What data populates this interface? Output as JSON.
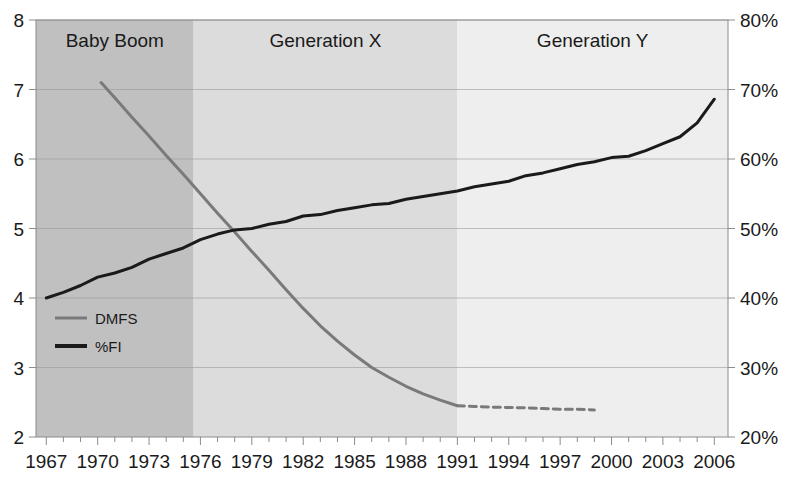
{
  "chart_data": {
    "type": "line",
    "title": "",
    "subtitle": "",
    "xlabel": "",
    "ylabel": "",
    "y2label": "",
    "xlim": [
      1966.4,
      2006.8
    ],
    "ylim": [
      2,
      8
    ],
    "y2lim": [
      20,
      80
    ],
    "grid": true,
    "legend_position": "inside-left",
    "x_tick_labels": [
      "1967",
      "1970",
      "1973",
      "1976",
      "1979",
      "1982",
      "1985",
      "1988",
      "1991",
      "1994",
      "1997",
      "2000",
      "2003",
      "2006"
    ],
    "x_tick_values": [
      1967,
      1970,
      1973,
      1976,
      1979,
      1982,
      1985,
      1988,
      1991,
      1994,
      1997,
      2000,
      2003,
      2006
    ],
    "x_minor_tick_step": 1,
    "y_tick_labels": [
      "2",
      "3",
      "4",
      "5",
      "6",
      "7",
      "8"
    ],
    "y_tick_values": [
      2,
      3,
      4,
      5,
      6,
      7,
      8
    ],
    "y2_tick_labels": [
      "20%",
      "30%",
      "40%",
      "50%",
      "60%",
      "70%",
      "80%"
    ],
    "y2_tick_values": [
      20,
      30,
      40,
      50,
      60,
      70,
      80
    ],
    "bands": [
      {
        "label": "Baby Boom",
        "x_start": 1966.4,
        "x_end": 1975.6,
        "color": "#c0c0c0"
      },
      {
        "label": "Generation X",
        "x_start": 1975.6,
        "x_end": 1991.0,
        "color": "#dcdcdc"
      },
      {
        "label": "Generation Y",
        "x_start": 1991.0,
        "x_end": 2006.8,
        "color": "#eeeeee"
      }
    ],
    "series": [
      {
        "name": "DMFS",
        "axis": "left",
        "color": "#7a7a7a",
        "width": 3,
        "style": "solid",
        "x": [
          1970.2,
          1971,
          1972,
          1973,
          1974,
          1975,
          1976,
          1977,
          1978,
          1979,
          1980,
          1981,
          1982,
          1983,
          1984,
          1985,
          1986,
          1987,
          1988,
          1989,
          1990,
          1991
        ],
        "values": [
          7.1,
          6.88,
          6.6,
          6.33,
          6.05,
          5.78,
          5.5,
          5.22,
          4.95,
          4.67,
          4.4,
          4.12,
          3.85,
          3.6,
          3.38,
          3.18,
          3.0,
          2.86,
          2.73,
          2.62,
          2.53,
          2.45
        ]
      },
      {
        "name": "DMFS-projected",
        "axis": "left",
        "color": "#7a7a7a",
        "width": 3,
        "style": "dashed",
        "x": [
          1991,
          1992,
          1993,
          1994,
          1995,
          1996,
          1997,
          1998,
          1999
        ],
        "values": [
          2.45,
          2.44,
          2.43,
          2.425,
          2.42,
          2.41,
          2.4,
          2.4,
          2.39
        ]
      },
      {
        "name": "%FI",
        "axis": "right",
        "color": "#1a1a1a",
        "width": 3,
        "style": "solid",
        "x": [
          1967,
          1968,
          1969,
          1970,
          1971,
          1972,
          1973,
          1974,
          1975,
          1976,
          1977,
          1978,
          1979,
          1980,
          1981,
          1982,
          1983,
          1984,
          1985,
          1986,
          1987,
          1988,
          1989,
          1990,
          1991,
          1992,
          1993,
          1994,
          1995,
          1996,
          1997,
          1998,
          1999,
          2000,
          2001,
          2002,
          2003,
          2004,
          2005,
          2006
        ],
        "values": [
          40.0,
          40.8,
          41.8,
          43.0,
          43.6,
          44.4,
          45.6,
          46.4,
          47.2,
          48.4,
          49.2,
          49.8,
          50.0,
          50.6,
          51.0,
          51.8,
          52.0,
          52.6,
          53.0,
          53.4,
          53.6,
          54.2,
          54.6,
          55.0,
          55.4,
          56.0,
          56.4,
          56.8,
          57.6,
          58.0,
          58.6,
          59.2,
          59.6,
          60.2,
          60.4,
          61.2,
          62.2,
          63.2,
          65.2,
          68.6
        ]
      }
    ],
    "legend": [
      {
        "label": "DMFS",
        "color": "#7a7a7a",
        "style": "solid",
        "width": 3
      },
      {
        "label": "%FI",
        "color": "#1a1a1a",
        "style": "solid",
        "width": 4
      }
    ]
  }
}
